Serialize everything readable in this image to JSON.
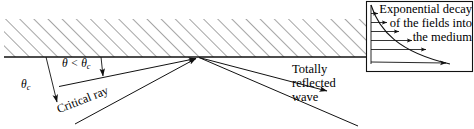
{
  "figure": {
    "background_color": "#ffffff",
    "line_color": "#1a1a1a",
    "hatch_color": "#555555",
    "width": 474,
    "height": 129
  },
  "labels": {
    "theta_c": "θ",
    "theta_c_sub": "c",
    "theta_less_than": "θ < θ",
    "theta_less_than_sub": "c",
    "critical_ray": "Critical ray",
    "totally_reflected_wave": "Totally reflected wave",
    "inset_caption": "Exponential decay of the fields into the medium"
  },
  "regions": {
    "medium": {
      "name": "hatched-medium",
      "hatch_angle_deg": 45,
      "hatch_spacing_px": 10,
      "top_y": 19,
      "bottom_y": 57,
      "left_x": 4,
      "right_x": 366
    },
    "interface": {
      "name": "interface-line",
      "y": 57,
      "x_start": 4,
      "x_end": 366
    }
  },
  "rays": {
    "incident": [
      {
        "name": "critical-ray",
        "label": "Critical ray",
        "from": [
          75,
          124
        ],
        "to": [
          199,
          57
        ],
        "arrow": true
      },
      {
        "name": "sub-critical-ray",
        "label": "θ < θc",
        "from": [
          59,
          86
        ],
        "to": [
          199,
          57
        ],
        "arrow": true
      }
    ],
    "reflected": [
      {
        "name": "totally-reflected-ray-upper",
        "from": [
          199,
          57
        ],
        "to": [
          330,
          92
        ],
        "arrow": true
      },
      {
        "name": "totally-reflected-ray-lower",
        "from": [
          199,
          57
        ],
        "to": [
          357,
          125
        ],
        "arrow": false
      }
    ],
    "normals": [
      {
        "name": "normal-theta-c",
        "from": [
          46,
          57
        ],
        "to": [
          58,
          106
        ],
        "arrow": true
      },
      {
        "name": "normal-theta",
        "from": [
          101,
          57
        ],
        "to": [
          103,
          80
        ],
        "arrow": true
      }
    ]
  },
  "inset": {
    "name": "evanescent-decay-inset",
    "box": {
      "x": 366,
      "y": 1,
      "width": 107,
      "height": 71
    },
    "caption": "Exponential decay of the fields into the medium",
    "curve": {
      "type": "exponential-decay",
      "description": "field amplitude decaying into the medium",
      "start": [
        372,
        6
      ],
      "end": [
        452,
        65
      ]
    },
    "field_arrows": [
      {
        "name": "field-arrow-1",
        "y": 14,
        "x_start": 371,
        "x_end": 381
      },
      {
        "name": "field-arrow-2",
        "y": 23,
        "x_start": 371,
        "x_end": 390
      },
      {
        "name": "field-arrow-3",
        "y": 32,
        "x_start": 371,
        "x_end": 401
      },
      {
        "name": "field-arrow-4",
        "y": 41,
        "x_start": 371,
        "x_end": 414
      },
      {
        "name": "field-arrow-5",
        "y": 50,
        "x_start": 371,
        "x_end": 428
      },
      {
        "name": "field-arrow-6",
        "y": 62,
        "x_start": 371,
        "x_end": 449
      }
    ]
  }
}
